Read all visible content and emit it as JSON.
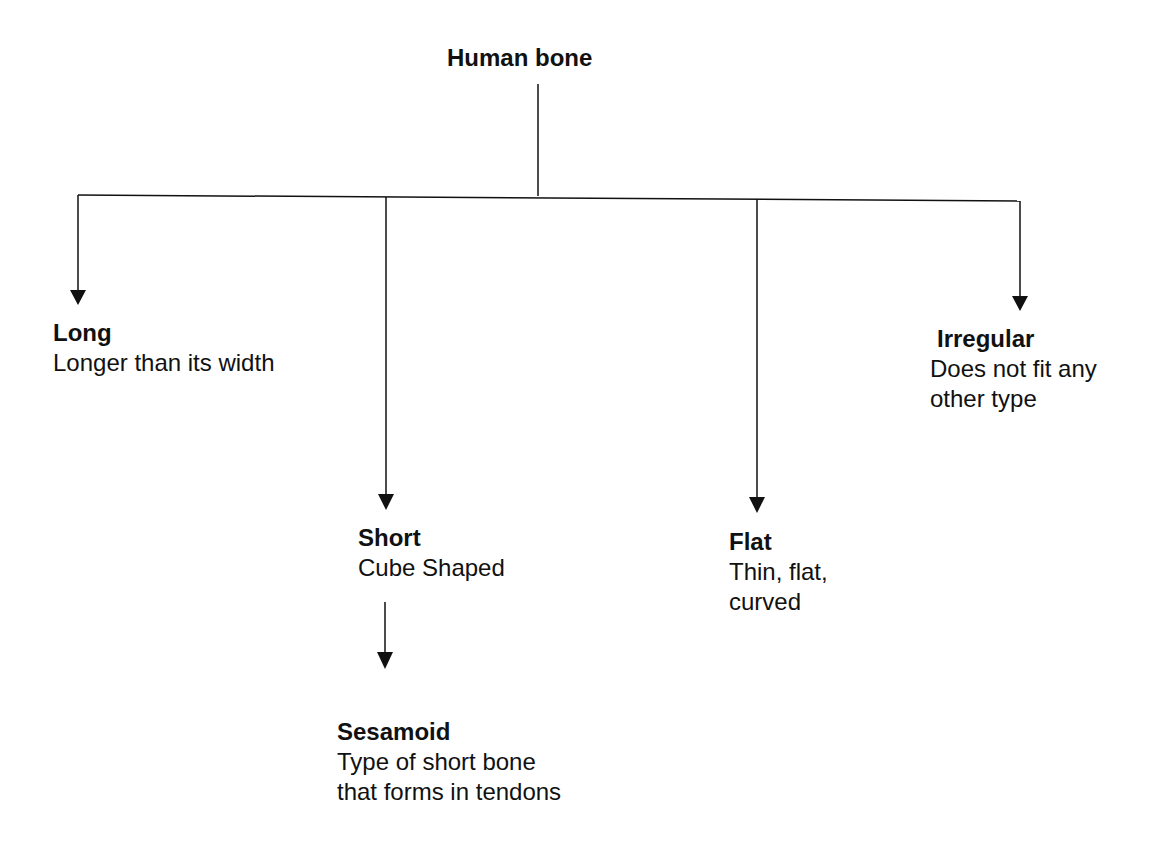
{
  "diagram": {
    "root": {
      "label": "Human bone"
    },
    "nodes": [
      {
        "id": "long",
        "title": "Long",
        "desc": "Longer than its width"
      },
      {
        "id": "short",
        "title": "Short",
        "desc": "Cube Shaped"
      },
      {
        "id": "flat",
        "title": "Flat",
        "desc": "Thin, flat,\ncurved"
      },
      {
        "id": "irregular",
        "title": "Irregular",
        "desc": "Does not fit any\nother type"
      },
      {
        "id": "sesamoid",
        "title": "Sesamoid",
        "desc": "Type of short bone\nthat forms in tendons"
      }
    ],
    "edges": [
      {
        "from": "Human bone",
        "to": "Long"
      },
      {
        "from": "Human bone",
        "to": "Short"
      },
      {
        "from": "Human bone",
        "to": "Flat"
      },
      {
        "from": "Human bone",
        "to": "Irregular"
      },
      {
        "from": "Short",
        "to": "Sesamoid"
      }
    ],
    "colors": {
      "line": "#111111",
      "background": "#ffffff"
    }
  }
}
